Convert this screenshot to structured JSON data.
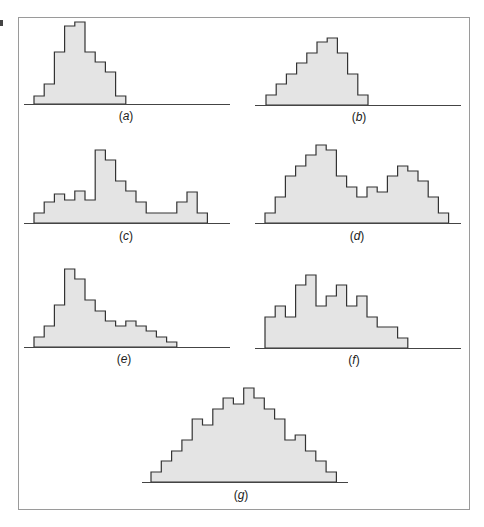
{
  "figure": {
    "frame_color": "#9a9a9a",
    "fill_color": "#e4e4e4",
    "stroke_color": "#333333",
    "axis_color": "#444444"
  },
  "chart_data": [
    {
      "type": "bar",
      "title": "(a)",
      "label_letter": "a",
      "description": "unimodal, skewed right",
      "values": [
        8,
        20,
        52,
        78,
        82,
        52,
        42,
        32,
        8
      ],
      "layout": {
        "x0": 34,
        "bin_w": 10.2,
        "baseline": 104,
        "axis_x1": 24,
        "axis_x2": 230,
        "label_x": 126,
        "label_y": 109
      }
    },
    {
      "type": "bar",
      "title": "(b)",
      "label_letter": "b",
      "description": "unimodal, skewed left",
      "values": [
        10,
        21,
        31,
        42,
        52,
        63,
        67,
        52,
        31,
        10
      ],
      "layout": {
        "x0": 266,
        "bin_w": 10.2,
        "baseline": 105,
        "axis_x1": 255,
        "axis_x2": 461,
        "label_x": 359,
        "label_y": 110
      }
    },
    {
      "type": "bar",
      "title": "(c)",
      "label_letter": "c",
      "description": "bimodal with tall narrow peak",
      "values": [
        10,
        21,
        29,
        23,
        32,
        23,
        73,
        63,
        42,
        32,
        21,
        10,
        10,
        10,
        21,
        31,
        10
      ],
      "layout": {
        "x0": 34,
        "bin_w": 10.2,
        "baseline": 223,
        "axis_x1": 24,
        "axis_x2": 230,
        "label_x": 126,
        "label_y": 229
      }
    },
    {
      "type": "bar",
      "title": "(d)",
      "label_letter": "d",
      "description": "bimodal",
      "values": [
        10,
        26,
        47,
        57,
        68,
        78,
        73,
        47,
        36,
        26,
        36,
        31,
        47,
        57,
        52,
        42,
        26,
        10
      ],
      "layout": {
        "x0": 265,
        "bin_w": 10.2,
        "baseline": 223,
        "axis_x1": 255,
        "axis_x2": 461,
        "label_x": 357,
        "label_y": 229
      }
    },
    {
      "type": "bar",
      "title": "(e)",
      "label_letter": "e",
      "description": "skewed right with long tail",
      "values": [
        10,
        21,
        42,
        78,
        68,
        47,
        36,
        26,
        21,
        26,
        21,
        16,
        10,
        5
      ],
      "layout": {
        "x0": 34,
        "bin_w": 10.2,
        "baseline": 347,
        "axis_x1": 24,
        "axis_x2": 230,
        "label_x": 124,
        "label_y": 352
      }
    },
    {
      "type": "bar",
      "title": "(f)",
      "label_letter": "f",
      "description": "irregular / multimodal",
      "values": [
        31,
        42,
        31,
        63,
        73,
        42,
        52,
        63,
        42,
        52,
        31,
        21,
        21,
        10
      ],
      "layout": {
        "x0": 265,
        "bin_w": 10.2,
        "baseline": 348,
        "axis_x1": 255,
        "axis_x2": 461,
        "label_x": 354,
        "label_y": 353
      }
    },
    {
      "type": "bar",
      "title": "(g)",
      "label_letter": "g",
      "description": "symmetric, roughly triangular",
      "values": [
        10,
        21,
        31,
        42,
        63,
        57,
        73,
        84,
        78,
        94,
        84,
        73,
        63,
        42,
        47,
        31,
        21,
        10
      ],
      "layout": {
        "x0": 151,
        "bin_w": 10.3,
        "baseline": 482,
        "axis_x1": 142,
        "axis_x2": 348,
        "label_x": 241,
        "label_y": 488
      }
    }
  ]
}
